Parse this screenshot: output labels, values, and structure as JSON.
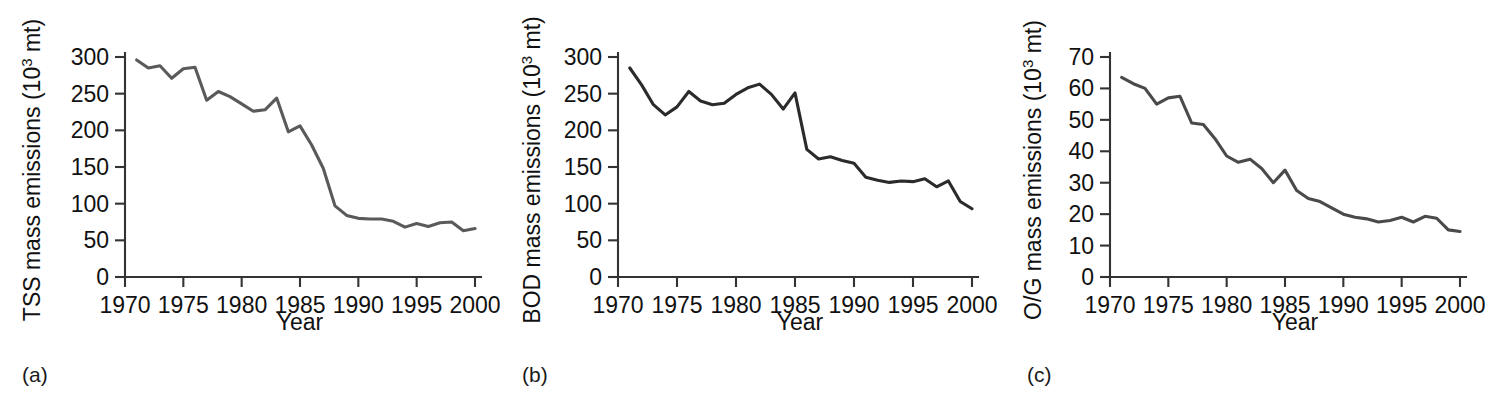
{
  "figure": {
    "panels": [
      {
        "id": "a",
        "label": "(a)",
        "ylabel_main": "TSS mass emissions (10",
        "ylabel_sup": "3",
        "ylabel_tail": " mt)",
        "xlabel": "Year",
        "line_color": "#5a5a5a"
      },
      {
        "id": "b",
        "label": "(b)",
        "ylabel_main": "BOD mass emissions (10",
        "ylabel_sup": "3",
        "ylabel_tail": " mt)",
        "xlabel": "Year",
        "line_color": "#2b2b2b"
      },
      {
        "id": "c",
        "label": "(c)",
        "ylabel_main": "O/G mass emissions (10",
        "ylabel_sup": "3",
        "ylabel_tail": " mt)",
        "xlabel": "Year",
        "line_color": "#4a4a4a"
      }
    ]
  },
  "chart_data": [
    {
      "type": "line",
      "panel": "a",
      "title": "",
      "xlabel": "Year",
      "ylabel": "TSS mass emissions (10^3 mt)",
      "xlim": [
        1970,
        2000
      ],
      "ylim": [
        0,
        300
      ],
      "xticks": [
        1970,
        1975,
        1980,
        1985,
        1990,
        1995,
        2000
      ],
      "yticks": [
        0,
        50,
        100,
        150,
        200,
        250,
        300
      ],
      "xtick_labels": [
        "1970",
        "1975",
        "1980",
        "1985",
        "1990",
        "1995",
        "2000"
      ],
      "ytick_labels": [
        "0",
        "50",
        "100",
        "150",
        "200",
        "250",
        "300"
      ],
      "grid": false,
      "legend": null,
      "series": [
        {
          "name": "TSS mass emissions",
          "x": [
            1971,
            1972,
            1973,
            1974,
            1975,
            1976,
            1977,
            1978,
            1979,
            1980,
            1981,
            1982,
            1983,
            1984,
            1985,
            1986,
            1987,
            1988,
            1989,
            1990,
            1991,
            1992,
            1993,
            1994,
            1995,
            1996,
            1997,
            1998,
            1999,
            2000
          ],
          "values": [
            296,
            285,
            288,
            271,
            284,
            286,
            241,
            253,
            246,
            236,
            226,
            228,
            244,
            198,
            206,
            180,
            148,
            97,
            84,
            80,
            79,
            79,
            76,
            68,
            73,
            69,
            74,
            75,
            63,
            66
          ]
        }
      ]
    },
    {
      "type": "line",
      "panel": "b",
      "title": "",
      "xlabel": "Year",
      "ylabel": "BOD mass emissions (10^3 mt)",
      "xlim": [
        1970,
        2000
      ],
      "ylim": [
        0,
        300
      ],
      "xticks": [
        1970,
        1975,
        1980,
        1985,
        1990,
        1995,
        2000
      ],
      "yticks": [
        0,
        50,
        100,
        150,
        200,
        250,
        300
      ],
      "xtick_labels": [
        "1970",
        "1975",
        "1980",
        "1985",
        "1990",
        "1995",
        "2000"
      ],
      "ytick_labels": [
        "0",
        "50",
        "100",
        "150",
        "200",
        "250",
        "300"
      ],
      "grid": false,
      "legend": null,
      "series": [
        {
          "name": "BOD mass emissions",
          "x": [
            1971,
            1972,
            1973,
            1974,
            1975,
            1976,
            1977,
            1978,
            1979,
            1980,
            1981,
            1982,
            1983,
            1984,
            1985,
            1986,
            1987,
            1988,
            1989,
            1990,
            1991,
            1992,
            1993,
            1994,
            1995,
            1996,
            1997,
            1998,
            1999,
            2000
          ],
          "values": [
            285,
            262,
            235,
            221,
            232,
            253,
            240,
            235,
            237,
            249,
            258,
            263,
            249,
            229,
            251,
            174,
            161,
            164,
            159,
            155,
            136,
            132,
            129,
            131,
            130,
            134,
            123,
            131,
            103,
            93
          ]
        }
      ]
    },
    {
      "type": "line",
      "panel": "c",
      "title": "",
      "xlabel": "Year",
      "ylabel": "O/G mass emissions (10^3 mt)",
      "xlim": [
        1970,
        2000
      ],
      "ylim": [
        0,
        70
      ],
      "xticks": [
        1970,
        1975,
        1980,
        1985,
        1990,
        1995,
        2000
      ],
      "yticks": [
        0,
        10,
        20,
        30,
        40,
        50,
        60,
        70
      ],
      "xtick_labels": [
        "1970",
        "1975",
        "1980",
        "1985",
        "1990",
        "1995",
        "2000"
      ],
      "ytick_labels": [
        "0",
        "10",
        "20",
        "30",
        "40",
        "50",
        "60",
        "70"
      ],
      "grid": false,
      "legend": null,
      "series": [
        {
          "name": "O/G mass emissions",
          "x": [
            1971,
            1972,
            1973,
            1974,
            1975,
            1976,
            1977,
            1978,
            1979,
            1980,
            1981,
            1982,
            1983,
            1984,
            1985,
            1986,
            1987,
            1988,
            1989,
            1990,
            1991,
            1992,
            1993,
            1994,
            1995,
            1996,
            1997,
            1998,
            1999,
            2000
          ],
          "values": [
            63.5,
            61.5,
            60.0,
            55.0,
            57.0,
            57.5,
            49.0,
            48.5,
            44.0,
            38.5,
            36.5,
            37.5,
            34.5,
            30.0,
            34.0,
            27.5,
            25.0,
            24.0,
            22.0,
            20.0,
            19.0,
            18.5,
            17.5,
            18.0,
            19.0,
            17.5,
            19.3,
            18.7,
            15.0,
            14.5
          ]
        }
      ]
    }
  ]
}
